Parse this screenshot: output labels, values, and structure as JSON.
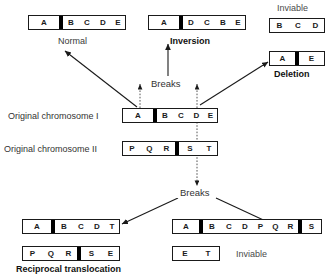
{
  "figure": {
    "title_hidden": "",
    "labels": {
      "normal": "Normal",
      "inversion": "Inversion",
      "inviable_top": "Inviable",
      "deletion": "Deletion",
      "breaks_upper": "Breaks",
      "breaks_lower": "Breaks",
      "original_chromosome_1": "Original chromosome I",
      "original_chromosome_2": "Original chromosome II",
      "reciprocal_translocation": "Reciprocal  translocation",
      "inviable_bottom": "Inviable"
    },
    "colors": {
      "outline": "#1a1a1a",
      "band": "#000000",
      "background": "#ffffff",
      "text": "#333333",
      "arrow": "#1a1a1a"
    }
  },
  "chromosomes": {
    "normal": {
      "name": "Normal chromosome",
      "segments": [
        "A",
        "B",
        "C",
        "D",
        "E"
      ],
      "band_after_index": 0
    },
    "inversion": {
      "name": "Inversion chromosome",
      "segments": [
        "A",
        "D",
        "C",
        "B",
        "E"
      ],
      "band_after_index": 0
    },
    "inviable_fragment_top": {
      "name": "Inviable acentric fragment",
      "segments": [
        "B",
        "C",
        "D"
      ],
      "band_after_index": -1
    },
    "deletion": {
      "name": "Deletion chromosome",
      "segments": [
        "A",
        "E"
      ],
      "band_after_index": 0
    },
    "original_1": {
      "name": "Original chromosome I",
      "segments": [
        "A",
        "B",
        "C",
        "D",
        "E"
      ],
      "band_after_index": 0
    },
    "original_2": {
      "name": "Original chromosome II",
      "segments": [
        "P",
        "Q",
        "R",
        "S",
        "T"
      ],
      "band_after_index": 2
    },
    "translocation_1": {
      "name": "Translocation product one",
      "segments": [
        "A",
        "B",
        "C",
        "D",
        "T"
      ],
      "band_after_index": 0
    },
    "translocation_2": {
      "name": "Translocation product two",
      "segments": [
        "P",
        "Q",
        "R",
        "S",
        "E"
      ],
      "band_after_index": 2
    },
    "dicentric": {
      "name": "Dicentric chromosome",
      "segments": [
        "A",
        "B",
        "C",
        "D",
        "P",
        "Q",
        "R",
        "S"
      ],
      "band_after_index": 0,
      "band2_after_index": 6
    },
    "acentric": {
      "name": "Acentric fragment",
      "segments": [
        "E",
        "T"
      ],
      "band_after_index": -1
    }
  }
}
